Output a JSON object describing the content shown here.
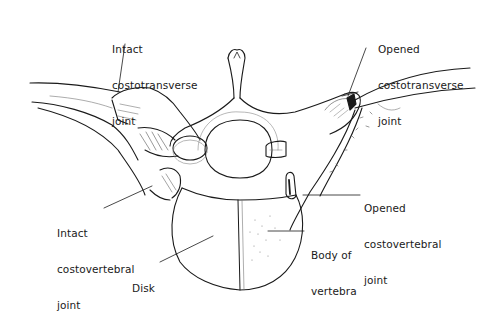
{
  "figure": {
    "colors": {
      "ink": "#1a1a1a",
      "background": "#ffffff",
      "shading": "#9a9a9a"
    }
  },
  "labels": {
    "intact_costotransverse": {
      "line1": "Intact",
      "line2": "costotransverse",
      "line3": "joint"
    },
    "opened_costotransverse": {
      "line1": "Opened",
      "line2": "costotransverse",
      "line3": "joint"
    },
    "intact_costovertebral": {
      "line1": "Intact",
      "line2": "costovertebral",
      "line3": "joint"
    },
    "opened_costovertebral": {
      "line1": "Opened",
      "line2": "costovertebral",
      "line3": "joint"
    },
    "body_of_vertebra": {
      "line1": "Body of",
      "line2": "vertebra"
    },
    "disk": {
      "line1": "Disk"
    }
  }
}
